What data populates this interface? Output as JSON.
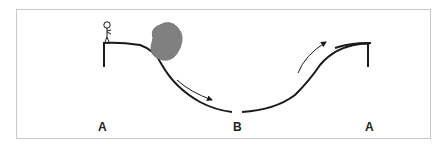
{
  "diagram": {
    "type": "physics-track",
    "labels": [
      {
        "text": "A",
        "position": "left-start"
      },
      {
        "text": "B",
        "position": "bottom-middle"
      },
      {
        "text": "A",
        "position": "right-end"
      }
    ],
    "elements": [
      {
        "name": "stick-figure",
        "description": "person standing at top-left of track"
      },
      {
        "name": "boulder",
        "description": "gray rock rolling down the slope",
        "color": "#808080"
      },
      {
        "name": "down-arrow",
        "description": "arrow indicating downward motion"
      },
      {
        "name": "up-arrow",
        "description": "arrow indicating upward motion"
      }
    ],
    "colors": {
      "track": "#1a1a1a",
      "boulder": "#808080",
      "frame": "#c8c8c8"
    }
  }
}
